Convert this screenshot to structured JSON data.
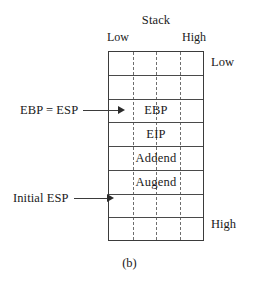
{
  "figure": {
    "title": "Stack",
    "caption": "(b)",
    "axis_top": {
      "left_label": "Low",
      "right_label": "High"
    },
    "axis_right": {
      "top_label": "Low",
      "bottom_label": "High"
    },
    "colors": {
      "border": "#3b3b3b",
      "divider": "#4a4a4a",
      "dashed_guide": "#6e6e6e",
      "text": "#1a1a1a",
      "background": "#ffffff"
    },
    "dashed_guides": {
      "count": 3,
      "positions_percent": [
        25,
        50,
        75
      ]
    },
    "rows": [
      {
        "label": "",
        "empty": true
      },
      {
        "label": "",
        "empty": true
      },
      {
        "label": "EBP",
        "empty": false
      },
      {
        "label": "EIP",
        "empty": false
      },
      {
        "label": "Addend",
        "empty": false
      },
      {
        "label": "Augend",
        "empty": false
      },
      {
        "label": "",
        "empty": true
      },
      {
        "label": "",
        "empty": true
      }
    ],
    "pointers": [
      {
        "label": "EBP = ESP",
        "target_row": 2
      },
      {
        "label": "Initial ESP",
        "target_row": 6
      }
    ]
  }
}
